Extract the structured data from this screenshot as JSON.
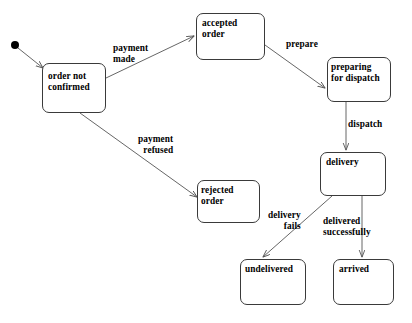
{
  "diagram": {
    "type": "state-machine",
    "background_color": "#ffffff",
    "stroke_color": "#3a3a3a",
    "text_color": "#000000",
    "initial_state": {
      "name": "initial-pseudostate",
      "x": 15,
      "y": 45,
      "radius": 4
    },
    "states": [
      {
        "id": "order_not_confirmed",
        "label": "order not\nconfirmed",
        "x": 42,
        "y": 63,
        "width": 64,
        "height": 50,
        "label_x": 48,
        "label_y": 71
      },
      {
        "id": "accepted_order",
        "label": "accepted\norder",
        "x": 196,
        "y": 13,
        "width": 69,
        "height": 47,
        "label_x": 202,
        "label_y": 18
      },
      {
        "id": "preparing_for_dispatch",
        "label": "preparing\nfor dispatch",
        "x": 327,
        "y": 57,
        "width": 64,
        "height": 45,
        "label_x": 331,
        "label_y": 62
      },
      {
        "id": "delivery",
        "label": "delivery",
        "x": 320,
        "y": 152,
        "width": 66,
        "height": 44,
        "label_x": 326,
        "label_y": 157
      },
      {
        "id": "rejected_order",
        "label": "rejected\norder",
        "x": 197,
        "y": 180,
        "width": 63,
        "height": 43,
        "label_x": 201,
        "label_y": 185
      },
      {
        "id": "undelivered",
        "label": "undelivered",
        "x": 240,
        "y": 259,
        "width": 66,
        "height": 46,
        "label_x": 245,
        "label_y": 264
      },
      {
        "id": "arrived",
        "label": "arrived",
        "x": 333,
        "y": 259,
        "width": 61,
        "height": 46,
        "label_x": 339,
        "label_y": 264
      }
    ],
    "transitions": [
      {
        "id": "start_to_order_not_confirmed",
        "from": "initial-pseudostate",
        "to": "order_not_confirmed",
        "label": "",
        "path": "M 18 48 L 43 68"
      },
      {
        "id": "payment_made",
        "from": "order_not_confirmed",
        "to": "accepted_order",
        "label": "payment\nmade",
        "label_x": 113,
        "label_y": 43,
        "label_align": "left",
        "path": "M 106 78 L 194 36"
      },
      {
        "id": "payment_refused",
        "from": "order_not_confirmed",
        "to": "rejected_order",
        "label": "payment\nrefused",
        "label_x": 138,
        "label_y": 134,
        "label_align": "right",
        "path": "M 80 113 L 197 197"
      },
      {
        "id": "prepare",
        "from": "accepted_order",
        "to": "preparing_for_dispatch",
        "label": "prepare",
        "label_x": 286,
        "label_y": 39,
        "label_align": "left",
        "path": "M 265 45 L 325 88"
      },
      {
        "id": "dispatch",
        "from": "preparing_for_dispatch",
        "to": "delivery",
        "label": "dispatch",
        "label_x": 348,
        "label_y": 119,
        "label_align": "left",
        "path": "M 346 102 L 346 150"
      },
      {
        "id": "delivery_fails",
        "from": "delivery",
        "to": "undelivered",
        "label": "delivery\nfails",
        "label_x": 268,
        "label_y": 210,
        "label_align": "right",
        "path": "M 332 196 L 263 257"
      },
      {
        "id": "delivered_successfully",
        "from": "delivery",
        "to": "arrived",
        "label": "delivered\nsuccessfully",
        "label_x": 323,
        "label_y": 216,
        "label_align": "left",
        "path": "M 362 196 L 362 257"
      }
    ]
  }
}
